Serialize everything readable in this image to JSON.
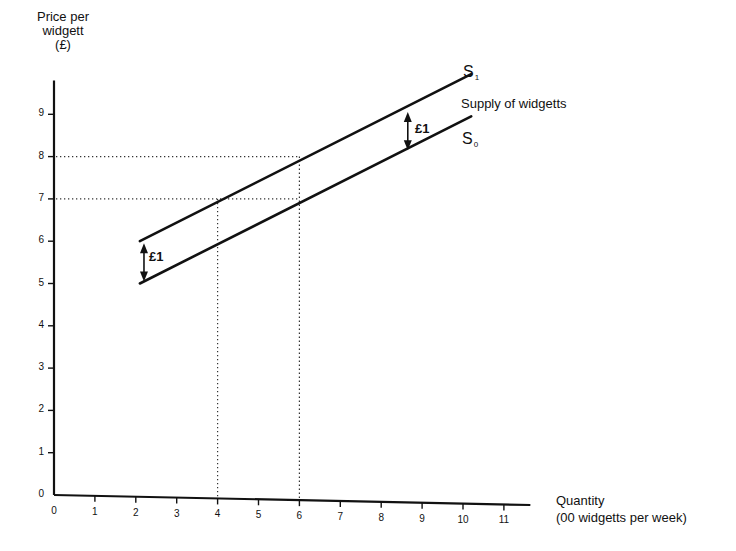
{
  "chart_data": {
    "type": "line",
    "title": "",
    "annotation_title": "Supply of widgetts",
    "ylabel": "Price per widgett (£)",
    "ylabel_lines": [
      "Price per",
      "widgett",
      "(£)"
    ],
    "xlabel": "Quantity (00 widgetts per week)",
    "xlabel_lines": [
      "Quantity",
      "(00 widgetts per week)"
    ],
    "xlim": [
      0,
      11.5
    ],
    "ylim": [
      0,
      9.8
    ],
    "x_ticks": [
      "0",
      "1",
      "2",
      "3",
      "4",
      "5",
      "6",
      "7",
      "8",
      "9",
      "10",
      "11"
    ],
    "y_ticks": [
      "0",
      "1",
      "2",
      "3",
      "4",
      "5",
      "6",
      "7",
      "8",
      "9"
    ],
    "grid": false,
    "series": [
      {
        "name": "S1",
        "label": "S",
        "subscript": "1",
        "points": [
          [
            2.1,
            6.0
          ],
          [
            4.0,
            7.0
          ],
          [
            6.0,
            8.0
          ],
          [
            10.2,
            9.95
          ]
        ]
      },
      {
        "name": "S0",
        "label": "S",
        "subscript": "0",
        "points": [
          [
            2.1,
            5.0
          ],
          [
            6.0,
            7.0
          ],
          [
            10.2,
            8.95
          ]
        ]
      }
    ],
    "reference_lines": [
      {
        "type": "horizontal",
        "y": 8,
        "x_from": 0,
        "x_to": 6,
        "style": "dotted"
      },
      {
        "type": "horizontal",
        "y": 7,
        "x_from": 0,
        "x_to": 6,
        "style": "dotted"
      },
      {
        "type": "vertical",
        "x": 4,
        "y_from": 0,
        "y_to": 7,
        "style": "dotted"
      },
      {
        "type": "vertical",
        "x": 6,
        "y_from": 0,
        "y_to": 8,
        "style": "dotted"
      }
    ],
    "annotations": [
      {
        "text": "£1",
        "type": "double-arrow",
        "x": 2.2,
        "y_from": 5.0,
        "y_to": 6.0
      },
      {
        "text": "£1",
        "type": "double-arrow",
        "x": 8.65,
        "y_from": 8.1,
        "y_to": 9.1
      }
    ]
  },
  "labels": {
    "ylabel": [
      "Price per",
      "widgett",
      "(£)"
    ],
    "xlabel": [
      "Quantity",
      "(00 widgetts per week)"
    ],
    "supply": "Supply of widgetts",
    "s1": "S",
    "s1_sub": "1",
    "s0": "S",
    "s0_sub": "0",
    "shift_left": "£1",
    "shift_right": "£1"
  }
}
